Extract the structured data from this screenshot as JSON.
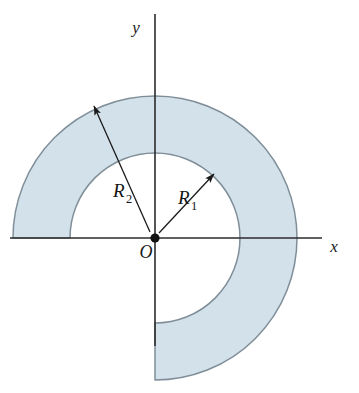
{
  "figure": {
    "background_color": "#ffffff",
    "region": {
      "name": "shaded-annular-sector",
      "fill_color": "#d3e1ea",
      "outline_color": "#7f8e98",
      "sweep_degrees": 270,
      "start_angle_degrees": 180,
      "end_angle_degrees": -90
    },
    "geometry": {
      "center_x": 155,
      "center_y": 238,
      "inner_radius": 85,
      "outer_radius": 142
    },
    "axes": {
      "x_label": "x",
      "y_label": "y",
      "origin_label": "O",
      "color": "#2b2b2b",
      "x_axis_start_x": 10,
      "x_axis_end_x": 322,
      "y_axis_top_y": 14,
      "y_axis_bottom_y": 346
    },
    "dimensions": [
      {
        "id": "outer-radius",
        "base": "R",
        "subscript": "2",
        "label": "R2",
        "label_x": 125,
        "label_y": 196,
        "arrow_tip_x": 92,
        "arrow_tip_y": 104,
        "describes": "outer radius"
      },
      {
        "id": "inner-radius",
        "base": "R",
        "subscript": "1",
        "label": "R1",
        "label_x": 190,
        "label_y": 203,
        "arrow_tip_x": 215,
        "arrow_tip_y": 172,
        "describes": "inner radius"
      }
    ]
  }
}
